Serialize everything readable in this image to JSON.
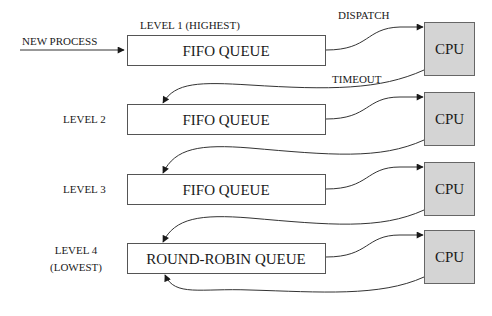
{
  "diagram": {
    "entry_label": "NEW PROCESS",
    "dispatch_label": "DISPATCH",
    "timeout_label": "TIMEOUT",
    "colors": {
      "cpu_fill": "#d4d4d4",
      "queue_fill": "#ffffff",
      "line": "#333333"
    },
    "levels": [
      {
        "label": "LEVEL 1 (HIGHEST)",
        "label_line2": "",
        "queue": "FIFO QUEUE",
        "cpu": "CPU"
      },
      {
        "label": "LEVEL 2",
        "label_line2": "",
        "queue": "FIFO QUEUE",
        "cpu": "CPU"
      },
      {
        "label": "LEVEL 3",
        "label_line2": "",
        "queue": "FIFO QUEUE",
        "cpu": "CPU"
      },
      {
        "label": "LEVEL 4",
        "label_line2": "(LOWEST)",
        "queue": "ROUND-ROBIN QUEUE",
        "cpu": "CPU"
      }
    ]
  }
}
